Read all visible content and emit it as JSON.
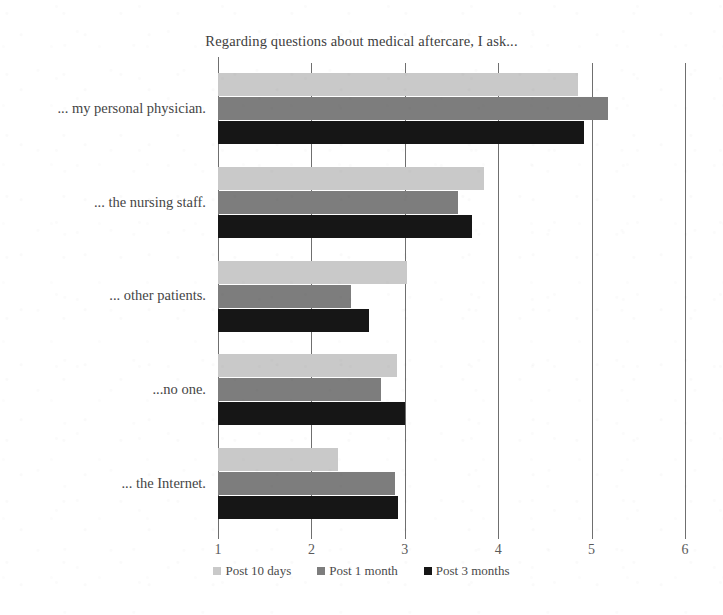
{
  "chart_data": {
    "type": "bar",
    "orientation": "horizontal",
    "title": "Regarding questions about medical aftercare, I ask...",
    "xlabel": "",
    "ylabel": "",
    "xlim": [
      1,
      6
    ],
    "xticks": [
      "1",
      "2",
      "3",
      "4",
      "5",
      "6"
    ],
    "grid": true,
    "legend_position": "bottom",
    "categories": [
      "... my personal physician.",
      "... the nursing staff.",
      "... other patients.",
      "...no one.",
      "... the Internet."
    ],
    "series": [
      {
        "name": "Post 10 days",
        "color": "#c9c9c9",
        "values": [
          4.85,
          3.85,
          3.02,
          2.92,
          2.28
        ]
      },
      {
        "name": "Post 1 month",
        "color": "#7d7d7d",
        "values": [
          5.18,
          3.57,
          2.42,
          2.74,
          2.89
        ]
      },
      {
        "name": "Post 3 months",
        "color": "#161616",
        "values": [
          4.92,
          3.72,
          2.62,
          3.0,
          2.93
        ]
      }
    ]
  }
}
